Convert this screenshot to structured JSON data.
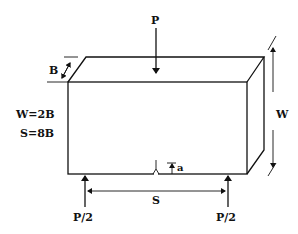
{
  "diagram": {
    "type": "three-point-bend-specimen",
    "labels": {
      "load": "P",
      "support_left": "P/2",
      "support_right": "P/2",
      "thickness": "B",
      "width": "W",
      "span": "S",
      "crack": "a",
      "relation_width": "W=2B",
      "relation_span": "S=8B"
    },
    "colors": {
      "line": "#111111",
      "background": "#ffffff"
    }
  }
}
